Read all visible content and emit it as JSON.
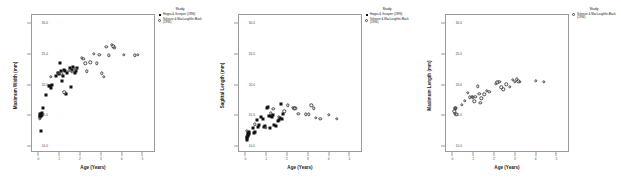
{
  "figure": {
    "panel_count": 3,
    "legend_title": "Study",
    "series_labels": {
      "hoppa": "Hoppa & Gruspier (1996)",
      "scheuer": "Scheuer & MacLaughlin-Black (1994)"
    },
    "marker_names": {
      "hoppa": "filled-square-marker",
      "scheuer": "open-circle-marker"
    }
  },
  "chart_data": [
    {
      "type": "scatter",
      "title": "",
      "xlabel": "Age (Years)",
      "ylabel": "Maximum Width (mm)",
      "xlim": [
        -0.35,
        5.6
      ],
      "ylim": [
        9.0,
        31.5
      ],
      "xticks": [
        "0",
        "1",
        "2",
        "3",
        "4",
        "5"
      ],
      "yticks": [
        "30.0",
        "25.0",
        "20.0",
        "15.0",
        "10.0"
      ],
      "grid": false,
      "legend_position": "top-right-outside",
      "series": [
        {
          "name": "Hoppa & Gruspier (1996)",
          "marker": "filled-square",
          "points": [
            [
              0.02,
              15.3
            ],
            [
              0.04,
              15.1
            ],
            [
              0.05,
              14.9
            ],
            [
              0.06,
              15.4
            ],
            [
              0.08,
              15.2
            ],
            [
              0.07,
              12.6
            ],
            [
              0.1,
              15.0
            ],
            [
              0.12,
              15.5
            ],
            [
              0.14,
              15.2
            ],
            [
              0.16,
              16.4
            ],
            [
              0.3,
              18.4
            ],
            [
              0.45,
              19.9
            ],
            [
              0.5,
              20.0
            ],
            [
              0.55,
              19.6
            ],
            [
              0.62,
              20.1
            ],
            [
              0.8,
              21.6
            ],
            [
              0.9,
              22.1
            ],
            [
              0.95,
              21.8
            ],
            [
              1.0,
              23.7
            ],
            [
              1.05,
              22.3
            ],
            [
              1.1,
              20.7
            ],
            [
              1.15,
              21.5
            ],
            [
              1.2,
              22.6
            ],
            [
              1.25,
              22.4
            ],
            [
              1.3,
              18.6
            ],
            [
              1.35,
              22.0
            ],
            [
              1.45,
              22.8
            ],
            [
              1.5,
              19.8
            ],
            [
              1.55,
              22.5
            ],
            [
              1.62,
              23.1
            ],
            [
              1.7,
              22.0
            ],
            [
              1.75,
              22.4
            ],
            [
              1.82,
              22.9
            ]
          ]
        },
        {
          "name": "Scheuer & MacLaughlin-Black (1994)",
          "marker": "open-circle",
          "points": [
            [
              0.03,
              14.6
            ],
            [
              0.55,
              21.4
            ],
            [
              0.92,
              22.1
            ],
            [
              1.05,
              21.9
            ],
            [
              1.2,
              18.9
            ],
            [
              1.42,
              22.4
            ],
            [
              1.58,
              22.2
            ],
            [
              1.72,
              22.7
            ],
            [
              2.05,
              24.5
            ],
            [
              2.12,
              24.4
            ],
            [
              2.2,
              23.6
            ],
            [
              2.28,
              22.3
            ],
            [
              2.45,
              23.8
            ],
            [
              2.62,
              25.2
            ],
            [
              2.75,
              23.6
            ],
            [
              2.88,
              25.0
            ],
            [
              3.0,
              22.0
            ],
            [
              3.1,
              21.4
            ],
            [
              3.22,
              26.3
            ],
            [
              3.35,
              24.9
            ],
            [
              3.48,
              26.6
            ],
            [
              3.55,
              26.4
            ],
            [
              3.6,
              26.2
            ],
            [
              4.05,
              25.0
            ],
            [
              4.58,
              24.9
            ],
            [
              4.72,
              25.0
            ]
          ]
        }
      ]
    },
    {
      "type": "scatter",
      "title": "",
      "xlabel": "Age (Years)",
      "ylabel": "Sagittal Length (mm)",
      "xlim": [
        -0.35,
        5.6
      ],
      "ylim": [
        9.0,
        31.5
      ],
      "xticks": [
        "0",
        "1",
        "2",
        "3",
        "4",
        "5"
      ],
      "yticks": [
        "30.0",
        "25.0",
        "20.0",
        "15.0",
        "10.0"
      ],
      "grid": false,
      "legend_position": "top-right-outside",
      "series": [
        {
          "name": "Hoppa & Gruspier (1996)",
          "marker": "filled-square",
          "points": [
            [
              0.02,
              11.4
            ],
            [
              0.03,
              11.2
            ],
            [
              0.05,
              11.6
            ],
            [
              0.06,
              12.0
            ],
            [
              0.08,
              11.8
            ],
            [
              0.1,
              12.2
            ],
            [
              0.12,
              12.1
            ],
            [
              0.15,
              12.5
            ],
            [
              0.3,
              13.1
            ],
            [
              0.35,
              12.2
            ],
            [
              0.42,
              12.4
            ],
            [
              0.5,
              14.4
            ],
            [
              0.58,
              13.3
            ],
            [
              0.62,
              13.5
            ],
            [
              0.7,
              14.9
            ],
            [
              0.78,
              14.6
            ],
            [
              0.85,
              13.2
            ],
            [
              0.92,
              13.4
            ],
            [
              1.0,
              16.3
            ],
            [
              1.05,
              16.5
            ],
            [
              1.1,
              15.1
            ],
            [
              1.12,
              13.0
            ],
            [
              1.2,
              15.0
            ],
            [
              1.25,
              14.9
            ],
            [
              1.3,
              15.2
            ],
            [
              1.35,
              13.6
            ],
            [
              1.42,
              13.4
            ],
            [
              1.5,
              14.2
            ],
            [
              1.55,
              14.4
            ],
            [
              1.6,
              14.7
            ],
            [
              1.65,
              17.0
            ],
            [
              1.7,
              14.6
            ],
            [
              1.78,
              15.3
            ]
          ]
        },
        {
          "name": "Scheuer & MacLaughlin-Black (1994)",
          "marker": "open-circle",
          "points": [
            [
              0.02,
              12.6
            ],
            [
              0.42,
              13.7
            ],
            [
              0.95,
              13.1
            ],
            [
              1.18,
              15.5
            ],
            [
              1.3,
              16.2
            ],
            [
              1.55,
              14.9
            ],
            [
              1.82,
              15.8
            ],
            [
              2.0,
              16.8
            ],
            [
              2.22,
              16.4
            ],
            [
              2.3,
              16.3
            ],
            [
              2.35,
              16.3
            ],
            [
              2.5,
              15.4
            ],
            [
              2.85,
              15.3
            ],
            [
              3.0,
              15.3
            ],
            [
              3.12,
              16.8
            ],
            [
              3.25,
              16.3
            ],
            [
              3.35,
              14.7
            ],
            [
              3.55,
              14.6
            ],
            [
              3.95,
              15.2
            ],
            [
              4.35,
              14.6
            ]
          ]
        }
      ]
    },
    {
      "type": "scatter",
      "title": "",
      "xlabel": "Age (Years)",
      "ylabel": "Maximum Length (mm)",
      "xlim": [
        -0.35,
        5.6
      ],
      "ylim": [
        9.0,
        31.5
      ],
      "xticks": [
        "0",
        "1",
        "2",
        "3",
        "4",
        "5"
      ],
      "yticks": [
        "30.0",
        "25.0",
        "20.0",
        "15.0",
        "10.0"
      ],
      "grid": false,
      "legend_position": "top-right-outside",
      "series": [
        {
          "name": "Scheuer & MacLaughlin-Black (1994)",
          "marker": "open-circle",
          "points": [
            [
              0.04,
              15.8
            ],
            [
              0.06,
              16.2
            ],
            [
              0.08,
              15.4
            ],
            [
              0.1,
              16.4
            ],
            [
              0.12,
              16.3
            ],
            [
              0.14,
              15.3
            ],
            [
              0.4,
              16.9
            ],
            [
              0.55,
              17.5
            ],
            [
              0.7,
              18.8
            ],
            [
              0.8,
              18.1
            ],
            [
              0.88,
              18.2
            ],
            [
              0.95,
              18.1
            ],
            [
              1.0,
              17.4
            ],
            [
              1.05,
              18.2
            ],
            [
              1.18,
              19.9
            ],
            [
              1.25,
              18.7
            ],
            [
              1.3,
              17.2
            ],
            [
              1.35,
              17.9
            ],
            [
              1.48,
              18.6
            ],
            [
              1.6,
              19.1
            ],
            [
              1.72,
              19.0
            ],
            [
              2.05,
              20.3
            ],
            [
              2.12,
              20.5
            ],
            [
              2.2,
              20.6
            ],
            [
              2.3,
              19.7
            ],
            [
              2.4,
              19.4
            ],
            [
              2.55,
              20.2
            ],
            [
              2.7,
              19.8
            ],
            [
              2.85,
              20.9
            ],
            [
              2.95,
              20.6
            ],
            [
              3.05,
              21.0
            ],
            [
              3.12,
              20.7
            ],
            [
              3.2,
              20.6
            ],
            [
              3.95,
              20.8
            ],
            [
              4.35,
              20.6
            ]
          ]
        }
      ]
    }
  ]
}
